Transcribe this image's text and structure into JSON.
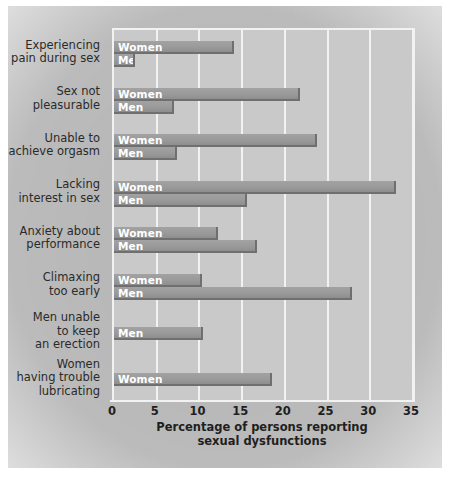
{
  "chart_data": {
    "type": "bar",
    "orientation": "horizontal",
    "title": "",
    "xlabel": "Percentage of persons reporting\nsexual dysfunctions",
    "ylabel": "",
    "xlim": [
      0,
      35
    ],
    "xticks": [
      0,
      5,
      10,
      15,
      20,
      25,
      30,
      35
    ],
    "xtick_labels": [
      "0",
      "5",
      "10",
      "15",
      "20",
      "25",
      "30",
      "35"
    ],
    "grid": true,
    "grid_axis": "x",
    "legend": "in-bar labels",
    "categories": [
      "Experiencing\npain during sex",
      "Sex not\npleasurable",
      "Unable to\nachieve orgasm",
      "Lacking\ninterest in sex",
      "Anxiety about\nperformance",
      "Climaxing\ntoo early",
      "Men unable\nto keep\nan erection",
      "Women\nhaving trouble\nlubricating"
    ],
    "series": [
      {
        "name": "Women",
        "values": [
          14.0,
          21.8,
          23.8,
          33.0,
          12.2,
          10.3,
          null,
          18.5
        ]
      },
      {
        "name": "Men",
        "values": [
          2.5,
          7.0,
          7.4,
          15.6,
          16.7,
          27.9,
          10.4,
          null
        ]
      }
    ],
    "groups": [
      {
        "category": "Experiencing\npain during sex",
        "bars": [
          {
            "series": "Women",
            "label": "Women",
            "value": 14.0
          },
          {
            "series": "Men",
            "label": "Men",
            "value": 2.5
          }
        ]
      },
      {
        "category": "Sex not\npleasurable",
        "bars": [
          {
            "series": "Women",
            "label": "Women",
            "value": 21.8
          },
          {
            "series": "Men",
            "label": "Men",
            "value": 7.0
          }
        ]
      },
      {
        "category": "Unable to\nachieve orgasm",
        "bars": [
          {
            "series": "Women",
            "label": "Women",
            "value": 23.8
          },
          {
            "series": "Men",
            "label": "Men",
            "value": 7.4
          }
        ]
      },
      {
        "category": "Lacking\ninterest in sex",
        "bars": [
          {
            "series": "Women",
            "label": "Women",
            "value": 33.0
          },
          {
            "series": "Men",
            "label": "Men",
            "value": 15.6
          }
        ]
      },
      {
        "category": "Anxiety about\nperformance",
        "bars": [
          {
            "series": "Women",
            "label": "Women",
            "value": 12.2
          },
          {
            "series": "Men",
            "label": "Men",
            "value": 16.7
          }
        ]
      },
      {
        "category": "Climaxing\ntoo early",
        "bars": [
          {
            "series": "Women",
            "label": "Women",
            "value": 10.3
          },
          {
            "series": "Men",
            "label": "Men",
            "value": 27.9
          }
        ]
      },
      {
        "category": "Men unable\nto keep\nan erection",
        "bars": [
          {
            "series": "Men",
            "label": "Men",
            "value": 10.4
          }
        ]
      },
      {
        "category": "Women\nhaving trouble\nlubricating",
        "bars": [
          {
            "series": "Women",
            "label": "Women",
            "value": 18.5
          }
        ]
      }
    ],
    "colors": {
      "bar_fill": "#9a9a9a",
      "bar_shadow": "#6f6f6f",
      "plot_background": "#c9c9c9",
      "gridline": "#f2f2f2",
      "bar_label_text": "#ffffff",
      "axis_text": "#1f1f1f",
      "category_text": "#2a2a2a",
      "page_background": "#ffffff"
    }
  }
}
